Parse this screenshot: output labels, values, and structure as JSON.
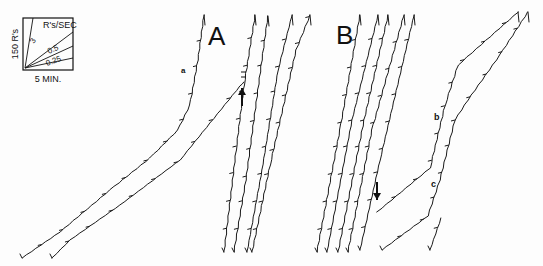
{
  "figure": {
    "panels": [
      {
        "label": "A",
        "x": 208,
        "y": 45,
        "size": 26
      },
      {
        "label": "B",
        "x": 336,
        "y": 44,
        "size": 26
      }
    ],
    "annotations": [
      {
        "text": "a",
        "x": 181,
        "y": 73,
        "size": 8
      },
      {
        "text": "b",
        "x": 434,
        "y": 120,
        "size": 9
      },
      {
        "text": "c",
        "x": 431,
        "y": 187,
        "size": 9
      }
    ],
    "legend": {
      "box": {
        "x": 23,
        "y": 18,
        "w": 50,
        "h": 52
      },
      "y_label": "150 R's",
      "x_label": "5 MIN.",
      "title": "R's/SEC",
      "rates": [
        "3",
        "0.5",
        "0.25"
      ]
    },
    "arrows": [
      {
        "name": "arrow-up-A",
        "x": 242,
        "y": 88,
        "dir": "up"
      },
      {
        "name": "arrow-down-B",
        "x": 377,
        "y": 200,
        "dir": "down"
      }
    ]
  },
  "chart_data": {
    "type": "line",
    "title": "",
    "xlabel": "5 MIN.",
    "ylabel": "150 R's",
    "legend_rates_responses_per_sec": [
      3,
      0.5,
      0.25
    ],
    "series": [
      {
        "name": "A-curve-1",
        "panel": "A",
        "points": [
          [
            22,
            258
          ],
          [
            60,
            232
          ],
          [
            110,
            190
          ],
          [
            150,
            158
          ],
          [
            178,
            130
          ],
          [
            190,
            105
          ],
          [
            198,
            60
          ],
          [
            204,
            15
          ]
        ]
      },
      {
        "name": "A-curve-2",
        "panel": "A",
        "points": [
          [
            52,
            258
          ],
          [
            70,
            240
          ],
          [
            120,
            205
          ],
          [
            180,
            160
          ],
          [
            240,
            86
          ],
          [
            244,
            82
          ]
        ]
      },
      {
        "name": "A-steep-1",
        "panel": "A",
        "points": [
          [
            224,
            252
          ],
          [
            236,
            150
          ],
          [
            244,
            85
          ],
          [
            255,
            15
          ]
        ]
      },
      {
        "name": "A-steep-2",
        "panel": "A",
        "points": [
          [
            234,
            252
          ],
          [
            246,
            180
          ],
          [
            262,
            60
          ],
          [
            268,
            16
          ]
        ]
      },
      {
        "name": "A-steep-3",
        "panel": "A",
        "points": [
          [
            247,
            252
          ],
          [
            262,
            170
          ],
          [
            278,
            70
          ],
          [
            292,
            15
          ]
        ]
      },
      {
        "name": "A-steep-4",
        "panel": "A",
        "points": [
          [
            252,
            252
          ],
          [
            270,
            165
          ],
          [
            296,
            50
          ],
          [
            310,
            15
          ]
        ]
      },
      {
        "name": "B-steep-1",
        "panel": "B",
        "points": [
          [
            317,
            252
          ],
          [
            340,
            130
          ],
          [
            360,
            15
          ]
        ]
      },
      {
        "name": "B-steep-2",
        "panel": "B",
        "points": [
          [
            327,
            252
          ],
          [
            352,
            120
          ],
          [
            378,
            15
          ]
        ]
      },
      {
        "name": "B-steep-3",
        "panel": "B",
        "points": [
          [
            338,
            252
          ],
          [
            364,
            120
          ],
          [
            388,
            15
          ]
        ]
      },
      {
        "name": "B-steep-4",
        "panel": "B",
        "points": [
          [
            348,
            252
          ],
          [
            372,
            130
          ],
          [
            404,
            15
          ]
        ]
      },
      {
        "name": "B-steep-5",
        "panel": "B",
        "points": [
          [
            360,
            250
          ],
          [
            380,
            160
          ],
          [
            414,
            15
          ]
        ]
      },
      {
        "name": "B-curve-b",
        "panel": "B",
        "points": [
          [
            377,
            212
          ],
          [
            430,
            168
          ],
          [
            445,
            105
          ],
          [
            458,
            65
          ],
          [
            518,
            12
          ]
        ]
      },
      {
        "name": "B-curve-c",
        "panel": "B",
        "points": [
          [
            382,
            250
          ],
          [
            428,
            216
          ],
          [
            440,
            180
          ],
          [
            455,
            120
          ],
          [
            468,
            100
          ],
          [
            500,
            55
          ],
          [
            528,
            12
          ]
        ]
      },
      {
        "name": "B-fragment",
        "panel": "B",
        "points": [
          [
            430,
            250
          ],
          [
            441,
            218
          ]
        ]
      }
    ]
  }
}
